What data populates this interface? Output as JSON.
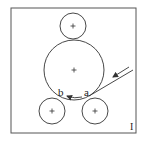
{
  "diagram": {
    "type": "roller-arrangement",
    "colors": {
      "stroke": "#333333",
      "background": "#ffffff"
    },
    "frame": {
      "x": 11,
      "y": 8,
      "width": 125,
      "height": 125
    },
    "rollers": [
      {
        "id": "top",
        "cx": 73,
        "cy": 26,
        "r": 13,
        "center_mark": "+"
      },
      {
        "id": "main",
        "cx": 74,
        "cy": 70,
        "r": 30,
        "center_mark": "+"
      },
      {
        "id": "bottom-left",
        "cx": 52,
        "cy": 111,
        "r": 13,
        "center_mark": "+"
      },
      {
        "id": "bottom-right",
        "cx": 95,
        "cy": 111,
        "r": 13,
        "center_mark": "+"
      }
    ],
    "labels": {
      "point_a": "a",
      "point_b": "b",
      "figure_id": "I"
    },
    "feed_line": {
      "from": [
        93,
        94
      ],
      "to": [
        133,
        70
      ]
    },
    "feed_arrow": {
      "from": [
        129,
        68
      ],
      "to": [
        113,
        78
      ]
    },
    "rotation_arrow": {
      "from": [
        82,
        97
      ],
      "to": [
        67,
        96
      ]
    }
  }
}
